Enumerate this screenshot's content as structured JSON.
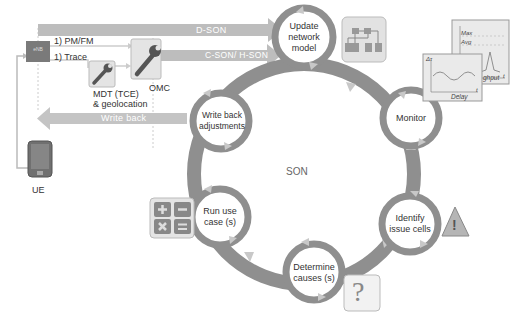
{
  "colors": {
    "ring": "#8f8f8f",
    "arrow": "#b9b9b9",
    "box": "#c8c8c8",
    "enb": "#7a7a7a",
    "icon_bg": "#e2e2e2",
    "text": "#333333"
  },
  "left": {
    "enb_label": "eNB",
    "pm_fm": "1) PM/FM",
    "trace": "1) Trace",
    "mdt_label_1": "MDT (TCE)",
    "mdt_label_2": "& geolocation",
    "omc_label": "OMC",
    "ue_label": "UE",
    "d_son": "D-SON",
    "c_son": "C-SON/ H-SON",
    "write_back": "Write back"
  },
  "cycle": {
    "center_label": "SON",
    "nodes": [
      {
        "id": "update",
        "line1": "Update",
        "line2": "network",
        "line3": "model"
      },
      {
        "id": "monitor",
        "line1": "Monitor"
      },
      {
        "id": "identify",
        "line1": "Identify",
        "line2": "issue cells"
      },
      {
        "id": "determine",
        "line1": "Determine",
        "line2": "causes (s)"
      },
      {
        "id": "run",
        "line1": "Run use",
        "line2": "case (s)"
      },
      {
        "id": "writeback",
        "line1": "Write back",
        "line2": "adjustments"
      }
    ]
  },
  "charts": {
    "throughput": {
      "y1": "Max",
      "y2": "Avg",
      "x": "ghput",
      "t": "t"
    },
    "delay": {
      "y": "Δτ",
      "x": "Delay",
      "t": "t"
    }
  },
  "icons": {
    "question": "?",
    "warning": "!"
  }
}
